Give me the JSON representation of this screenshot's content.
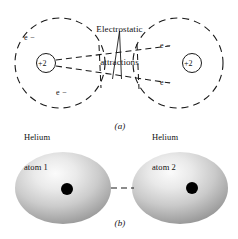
{
  "figure": {
    "title": "Electrostatic\nattractions",
    "title_line1": "Electrostatic",
    "title_line2": "attractions",
    "background_color": "#ffffff",
    "ink_color": "#111111"
  },
  "part_a": {
    "label": "(a)",
    "left_atom": {
      "nucleus_charge": "+2",
      "electron_upper": "e −",
      "electron_lower": "e −",
      "caption_line1": "Helium",
      "caption_line2": "atom 1",
      "circle": {
        "cx": 60,
        "cy": 63,
        "r": 45,
        "style": "dashed"
      }
    },
    "right_atom": {
      "nucleus_charge": "+2",
      "electron_upper": "e −",
      "electron_lower": "e −",
      "caption_line1": "Helium",
      "caption_line2": "atom 2",
      "circle": {
        "cx": 178,
        "cy": 63,
        "r": 45,
        "style": "dashed"
      }
    },
    "attraction_lines": [
      {
        "from": [
          64,
          60
        ],
        "to": [
          172,
          46
        ],
        "style": "dashed"
      },
      {
        "from": [
          64,
          66
        ],
        "to": [
          172,
          82
        ],
        "style": "dashed"
      },
      {
        "from": [
          100,
          45
        ],
        "to": [
          100,
          88
        ],
        "style": "dashed"
      },
      {
        "from": [
          136,
          45
        ],
        "to": [
          136,
          88
        ],
        "style": "dashed"
      }
    ],
    "pointer": {
      "apex": [
        119,
        30
      ],
      "left_foot": [
        112,
        80
      ],
      "right_foot": [
        121,
        80
      ]
    }
  },
  "part_b": {
    "label": "(b)",
    "left_sphere": {
      "cx": 63,
      "cy": 188,
      "rx": 48,
      "ry": 36,
      "dot_x": 67,
      "dot_y": 189,
      "dot_r": 6
    },
    "right_sphere": {
      "cx": 180,
      "cy": 188,
      "rx": 48,
      "ry": 36,
      "dot_x": 192,
      "dot_y": 188,
      "dot_r": 6
    },
    "bond": {
      "from": [
        112,
        188
      ],
      "to": [
        133,
        188
      ],
      "style": "dashed"
    },
    "sphere_highlight_color": "#f2f2f2",
    "sphere_mid_color": "#bdbdbd",
    "sphere_edge_color": "#8c8c8c",
    "dot_color": "#000000"
  }
}
